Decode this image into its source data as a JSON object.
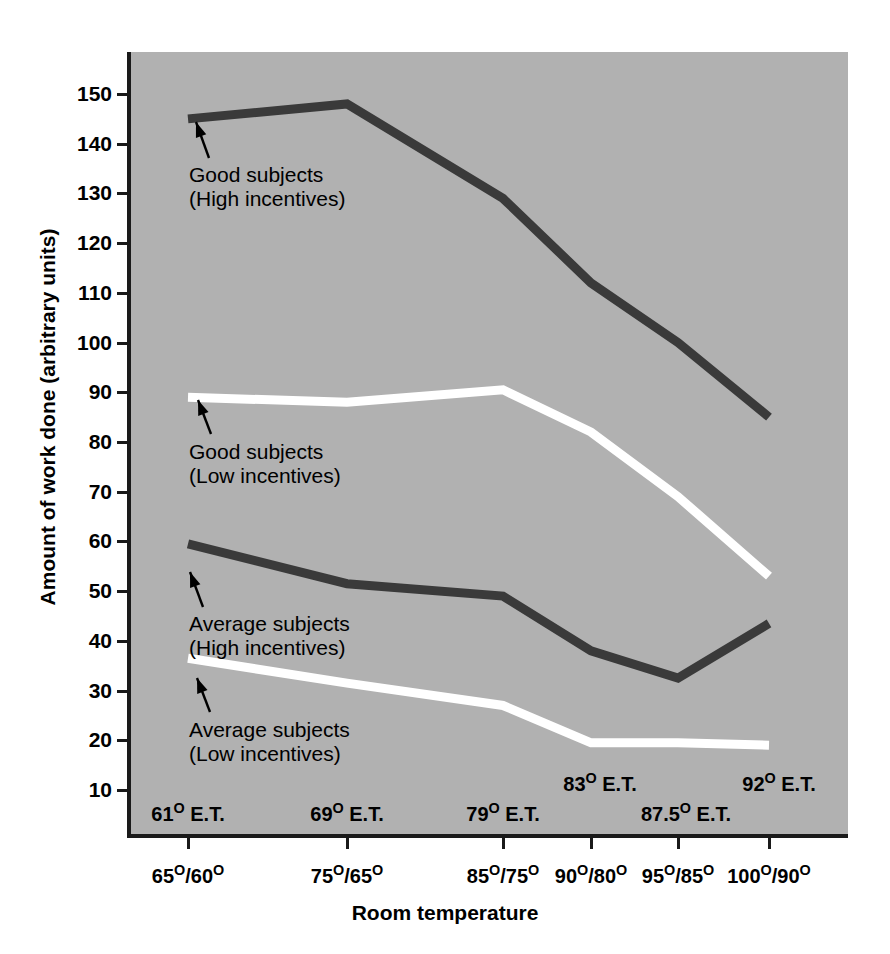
{
  "chart_data": {
    "type": "line",
    "title": "",
    "xlabel": "Room temperature",
    "ylabel": "Amount of work done (arbitrary units)",
    "ylim": [
      0,
      155
    ],
    "yticks": [
      10,
      20,
      30,
      40,
      50,
      60,
      70,
      80,
      90,
      100,
      110,
      120,
      130,
      140,
      150
    ],
    "grid": false,
    "legend_position": "inline-annotations",
    "background_color": "#b1b1b1",
    "categories": [
      "65°/60°",
      "75°/65°",
      "85°/75°",
      "90°/80°",
      "95°/85°",
      "100°/90°"
    ],
    "category_et_labels": [
      "61° E.T.",
      "69° E.T.",
      "79° E.T.",
      "83° E.T.",
      "87.5° E.T.",
      "92° E.T."
    ],
    "series": [
      {
        "name": "Good subjects (High incentives)",
        "color": "#3a3a3a",
        "values": [
          145,
          148,
          129,
          112,
          100,
          85
        ]
      },
      {
        "name": "Good subjects (Low incentives)",
        "color": "#ffffff",
        "values": [
          89,
          88,
          90.5,
          82,
          69,
          53
        ]
      },
      {
        "name": "Average subjects (High incentives)",
        "color": "#3a3a3a",
        "values": [
          59.5,
          51.5,
          49,
          38,
          32.5,
          43.5
        ]
      },
      {
        "name": "Average subjects (Low incentives)",
        "color": "#ffffff",
        "values": [
          36.5,
          31.5,
          27,
          19.5,
          19.5,
          19
        ]
      }
    ]
  },
  "axes": {
    "y_title": "Amount of work done (arbitrary units)",
    "x_title": "Room temperature",
    "y_tick_labels": [
      "150",
      "140",
      "130",
      "120",
      "110",
      "100",
      "90",
      "80",
      "70",
      "60",
      "50",
      "40",
      "30",
      "20",
      "10"
    ],
    "x_tick_labels": [
      "65°/60°",
      "75°/65°",
      "85°/75°",
      "90°/80°",
      "95°/85°",
      "100°/90°"
    ],
    "et_labels": [
      "61° E.T.",
      "69° E.T.",
      "79° E.T.",
      "83° E.T.",
      "87.5° E.T.",
      "92° E.T."
    ]
  },
  "annotations": [
    {
      "line1": "Good subjects",
      "line2": "(High incentives)"
    },
    {
      "line1": "Good subjects",
      "line2": "(Low incentives)"
    },
    {
      "line1": "Average subjects",
      "line2": "(High incentives)"
    },
    {
      "line1": "Average subjects",
      "line2": "(Low incentives)"
    }
  ]
}
